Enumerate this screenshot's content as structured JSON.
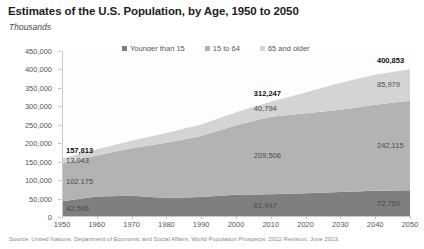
{
  "header": {
    "title": "Estimates of the U.S. Population, by Age, 1950 to 2050",
    "subtitle": "Thousands"
  },
  "legend": {
    "items": [
      {
        "label": "Younger than 15",
        "color": "#7f7f7f"
      },
      {
        "label": "15 to 64",
        "color": "#b3b3b3"
      },
      {
        "label": "65 and older",
        "color": "#d4d4d4"
      }
    ]
  },
  "source": {
    "text": "Source: United Nations, Department of Economic and Social Affairs, World Population Prospects: 2012 Revision, June 2013."
  },
  "chart_data": {
    "type": "area",
    "stacked": true,
    "title": "Estimates of the U.S. Population, by Age, 1950 to 2050",
    "subtitle": "Thousands",
    "xlabel": "",
    "ylabel": "Thousands",
    "ylim": [
      0,
      450000
    ],
    "ytick_step": 50000,
    "ytick_labels": [
      "450,000",
      "400,000",
      "350,000",
      "300,000",
      "250,000",
      "200,000",
      "150,000",
      "100,000",
      "50,000",
      "0"
    ],
    "ytick_values": [
      450000,
      400000,
      350000,
      300000,
      250000,
      200000,
      150000,
      100000,
      50000,
      0
    ],
    "grid": false,
    "legend_position": "top",
    "x": [
      1950,
      1960,
      1970,
      1980,
      1990,
      2000,
      2010,
      2020,
      2030,
      2040,
      2050
    ],
    "xtick_labels": [
      "1950",
      "1960",
      "1970",
      "1980",
      "1990",
      "2000",
      "2010",
      "2020",
      "2030",
      "2040",
      "2050"
    ],
    "series": [
      {
        "name": "Younger than 15",
        "color": "#7f7f7f",
        "values": [
          42596,
          55818,
          57900,
          51290,
          54060,
          60253,
          61947,
          64370,
          68100,
          71200,
          72759
        ]
      },
      {
        "name": "15 to 64",
        "color": "#b3b3b3",
        "values": [
          102175,
          111120,
          128700,
          150300,
          165600,
          188400,
          209506,
          216600,
          222600,
          233000,
          242115
        ]
      },
      {
        "name": "65 and older",
        "color": "#d4d4d4",
        "values": [
          13043,
          16900,
          20400,
          26000,
          31200,
          35100,
          40794,
          56400,
          73500,
          81600,
          85979
        ]
      }
    ],
    "totals": [
      157813,
      183838,
      207000,
      227590,
      250860,
      283753,
      312247,
      337370,
      364200,
      385800,
      400853
    ],
    "annotations": [
      {
        "text": "157,813",
        "x": 1950,
        "kind": "total",
        "bold": true
      },
      {
        "text": "13,043",
        "x": 1950,
        "series": "65 and older"
      },
      {
        "text": "102,175",
        "x": 1950,
        "series": "15 to 64"
      },
      {
        "text": "42,596",
        "x": 1950,
        "series": "Younger than 15"
      },
      {
        "text": "312,247",
        "x": 2010,
        "kind": "total",
        "bold": true
      },
      {
        "text": "40,794",
        "x": 2010,
        "series": "65 and older"
      },
      {
        "text": "209,506",
        "x": 2010,
        "series": "15 to 64"
      },
      {
        "text": "61,947",
        "x": 2010,
        "series": "Younger than 15"
      },
      {
        "text": "400,853",
        "x": 2050,
        "kind": "total",
        "bold": true
      },
      {
        "text": "85,979",
        "x": 2050,
        "series": "65 and older"
      },
      {
        "text": "242,115",
        "x": 2050,
        "series": "15 to 64"
      },
      {
        "text": "72,759",
        "x": 2050,
        "series": "Younger than 15"
      }
    ]
  }
}
